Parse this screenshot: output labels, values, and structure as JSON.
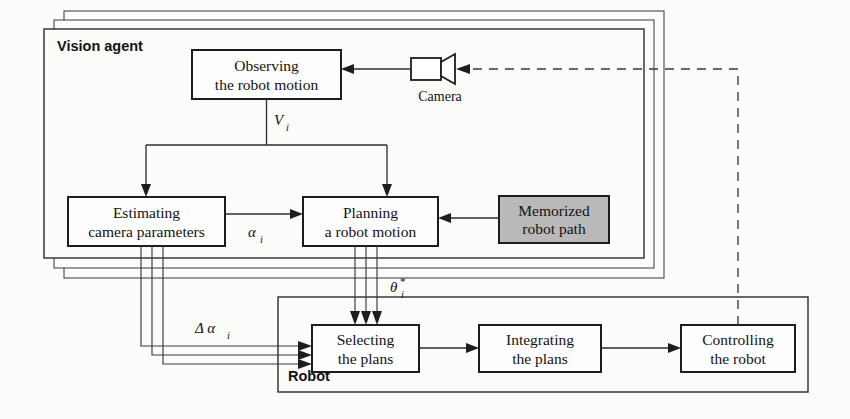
{
  "diagram": {
    "background_color": "#fbfbf9",
    "line_color": "#2b2b2b",
    "shaded_fill": "#b9b9b9",
    "panels": [
      {
        "id": "vision-agent",
        "label": "Vision agent",
        "stacked_copies": 3,
        "note": "multiple identical vision agents drawn as stacked offset panels"
      },
      {
        "id": "robot",
        "label": "Robot",
        "stacked_copies": 1
      }
    ],
    "nodes": [
      {
        "id": "observing",
        "line1": "Observing",
        "line2": "the robot motion",
        "shaded": false
      },
      {
        "id": "estimating",
        "line1": "Estimating",
        "line2": "camera parameters",
        "shaded": false
      },
      {
        "id": "planning",
        "line1": "Planning",
        "line2": "a robot motion",
        "shaded": false
      },
      {
        "id": "memorized",
        "line1": "Memorized",
        "line2": "robot path",
        "shaded": true
      },
      {
        "id": "selecting",
        "line1": "Selecting",
        "line2": "the plans",
        "shaded": false
      },
      {
        "id": "integrating",
        "line1": "Integrating",
        "line2": "the plans",
        "shaded": false
      },
      {
        "id": "controlling",
        "line1": "Controlling",
        "line2": "the robot",
        "shaded": false
      }
    ],
    "camera": {
      "label": "Camera",
      "icon": "video-camera-icon"
    },
    "signals": [
      {
        "id": "v-i",
        "symbol": "V",
        "subscript": "i",
        "star": "",
        "from": "observing",
        "to": "estimating, planning"
      },
      {
        "id": "alpha-i",
        "symbol": "α",
        "subscript": "i",
        "star": "",
        "from": "estimating",
        "to": "planning"
      },
      {
        "id": "theta-i",
        "symbol": "θ",
        "subscript": "i",
        "star": "*",
        "from": "planning",
        "to": "selecting"
      },
      {
        "id": "delta-alpha-i",
        "symbol": "Δ α",
        "subscript": "i",
        "star": "",
        "from": "estimating",
        "to": "selecting"
      }
    ],
    "edges": [
      {
        "from": "camera",
        "to": "observing",
        "style": "solid",
        "label": ""
      },
      {
        "from": "observing",
        "to": "estimating",
        "style": "solid",
        "label": "V_i"
      },
      {
        "from": "observing",
        "to": "planning",
        "style": "solid",
        "label": "V_i"
      },
      {
        "from": "estimating",
        "to": "planning",
        "style": "solid",
        "label": "alpha_i"
      },
      {
        "from": "memorized",
        "to": "planning",
        "style": "solid",
        "label": ""
      },
      {
        "from": "planning",
        "to": "selecting",
        "style": "solid",
        "label": "theta_i_star",
        "multiplicity": 3
      },
      {
        "from": "estimating",
        "to": "selecting",
        "style": "solid",
        "label": "delta_alpha_i",
        "multiplicity": 3
      },
      {
        "from": "selecting",
        "to": "integrating",
        "style": "solid",
        "label": ""
      },
      {
        "from": "integrating",
        "to": "controlling",
        "style": "solid",
        "label": ""
      },
      {
        "from": "controlling",
        "to": "camera",
        "style": "dashed",
        "label": ""
      }
    ]
  }
}
